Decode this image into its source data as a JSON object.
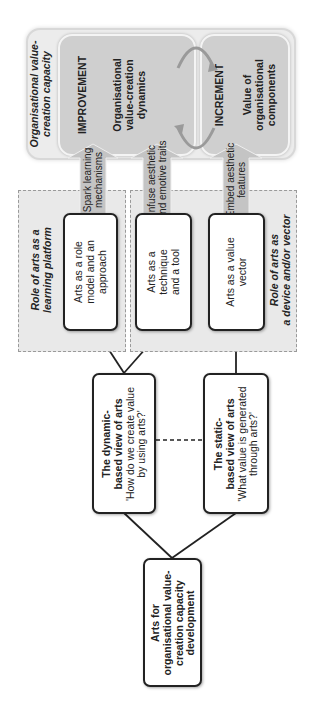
{
  "capacity_panel": {
    "label_line1": "Organisational value-",
    "label_line2": "creation capacity"
  },
  "improvement": {
    "title": "IMPROVEMENT",
    "line1": "Organisational",
    "line2": "value-creation",
    "line3": "dynamics"
  },
  "increment": {
    "title": "INCREMENT",
    "line1": "Value of",
    "line2": "organisational",
    "line3": "components"
  },
  "arrows": [
    {
      "line1": "Spark learning",
      "line2": "mechanisms"
    },
    {
      "line1": "Infuse aesthetic",
      "line2": "and emotive traits"
    },
    {
      "line1": "Embed aesthetic",
      "line2": "features"
    }
  ],
  "groups": {
    "learning_platform": {
      "line1": "Role of arts as a",
      "line2": "learning platform"
    },
    "device_vector": {
      "line1": "Role of arts as",
      "line2": "a device and/or vector"
    }
  },
  "roles": [
    {
      "line1": "Arts as a role",
      "line2": "model and an",
      "line3": "approach"
    },
    {
      "line1": "Arts as a",
      "line2": "technique",
      "line3": "and a tool"
    },
    {
      "line1": "Arts as a value",
      "line2": "vector",
      "line3": ""
    }
  ],
  "views": {
    "dynamic": {
      "title_line1": "The dynamic-",
      "title_line2": "based view of arts",
      "question_line1": "'How do we create value",
      "question_line2": "by using arts?'"
    },
    "static": {
      "title_line1": "The static-",
      "title_line2": "based view of arts",
      "question_line1": "'What value is generated",
      "question_line2": "through arts?'"
    }
  },
  "root": {
    "line1": "Arts for",
    "line2": "organisational value-",
    "line3": "creation capacity",
    "line4": "development"
  },
  "colors": {
    "panel_bg": "#ececec",
    "inner_bg": "#cfcfcf",
    "arrow_fill": "#c4c4c4",
    "box_border": "#222222",
    "dashed_group_bg": "#e9e9e9"
  }
}
